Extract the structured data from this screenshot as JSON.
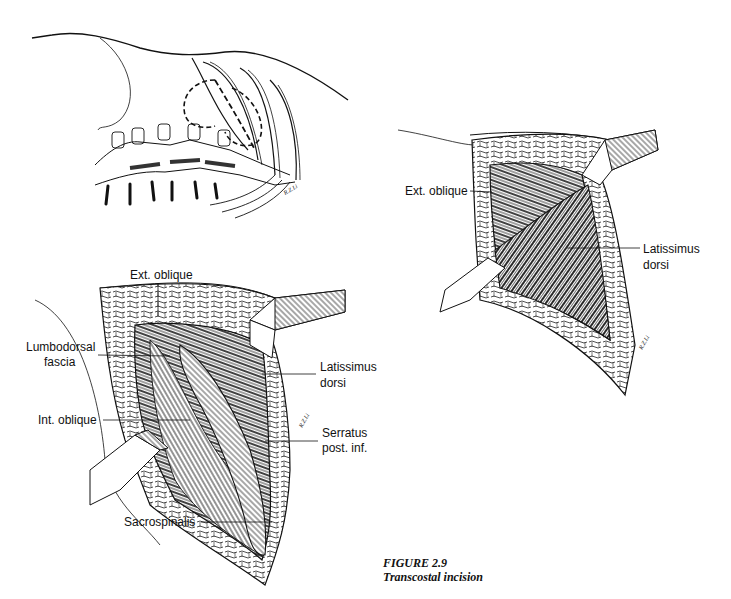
{
  "figure": {
    "number": "FIGURE 2.9",
    "title": "Transcostal incision"
  },
  "panels": {
    "top_left": {
      "description": "Skeletal overview: spine and lower ribs with dashed incision outline",
      "signature": "R.Z.Li"
    },
    "bottom_left": {
      "labels": [
        {
          "text": "Ext. oblique"
        },
        {
          "text": "Lumbodorsal"
        },
        {
          "text": "fascia"
        },
        {
          "text": "Latissimus"
        },
        {
          "text": "dorsi"
        },
        {
          "text": "Int. oblique"
        },
        {
          "text": "Serratus"
        },
        {
          "text": "post. inf."
        },
        {
          "text": "Sacrospinalis"
        }
      ],
      "signature": "R.Z.Li"
    },
    "right": {
      "labels": [
        {
          "text": "Ext. oblique"
        },
        {
          "text": "Latissimus"
        },
        {
          "text": "dorsi"
        }
      ],
      "signature": "R.Z.Li"
    }
  },
  "colors": {
    "ink": "#111111",
    "background": "#ffffff"
  }
}
